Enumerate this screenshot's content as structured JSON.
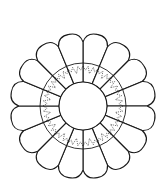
{
  "figure": {
    "petal_count": 16,
    "center": [
      83,
      106
    ],
    "inner_radius": 24,
    "ring_radius": 43,
    "outer_radius": 73,
    "stroke_color": "#1a1a1a",
    "fill_color": "#ffffff",
    "background": "#ffffff"
  }
}
